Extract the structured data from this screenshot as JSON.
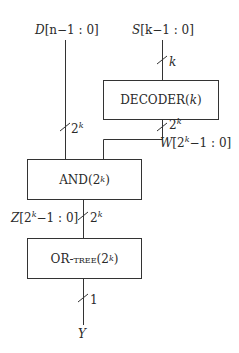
{
  "inputs": {
    "d": {
      "name": "D",
      "range": "[n−1 : 0]"
    },
    "s": {
      "name": "S",
      "range": "[k−1 : 0]"
    }
  },
  "blocks": {
    "decoder": {
      "name": "DECODER",
      "arg": "k"
    },
    "and": {
      "name": "AND",
      "arg_base": "2",
      "arg_exp": "k"
    },
    "or_tree": {
      "name": "OR-tree",
      "arg_base": "2",
      "arg_exp": "k"
    }
  },
  "buses": {
    "s_width": "k",
    "d_width_base": "2",
    "d_width_exp": "k",
    "decoder_out_base": "2",
    "decoder_out_exp": "k",
    "and_out_base": "2",
    "and_out_exp": "k",
    "y_width": "1"
  },
  "signals": {
    "w": {
      "name": "W",
      "base": "2",
      "exp": "k",
      "suffix": "−1 : 0]"
    },
    "z": {
      "name": "Z",
      "base": "2",
      "exp": "k",
      "suffix": "−1 : 0]"
    },
    "y": {
      "name": "Y"
    }
  }
}
